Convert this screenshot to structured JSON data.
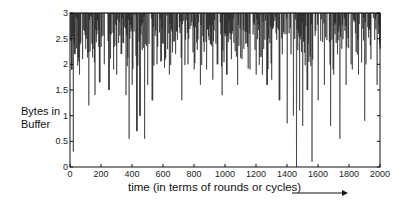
{
  "chart_data": {
    "type": "line",
    "title": "",
    "xlabel": "time (in terms of rounds or cycles)",
    "ylabel": "Bytes in Buffer",
    "xlim": [
      0,
      2000
    ],
    "ylim": [
      0,
      3
    ],
    "xticks": [
      0,
      200,
      400,
      600,
      800,
      1000,
      1200,
      1400,
      1600,
      1800,
      2000
    ],
    "yticks": [
      0,
      0.5,
      1,
      1.5,
      2,
      2.5,
      3
    ],
    "ytick_labels": [
      "0",
      "0.5",
      "1",
      "1.5",
      "2",
      "2.5",
      "3"
    ],
    "grid": false,
    "legend": null,
    "annotations": [
      "arrow pointing right after x-axis label"
    ],
    "series": [
      {
        "name": "Bytes in Buffer",
        "description": "Dense time series mostly saturated at 3 with frequent downward spikes; deepest dips near t≈20 (0.3), t≈380 (0.55), t≈480 (0.55), t≈1460 (0.0), t≈1560 (0.1)",
        "x": [
          0,
          10,
          20,
          30,
          60,
          80,
          100,
          120,
          140,
          160,
          190,
          220,
          250,
          280,
          300,
          330,
          360,
          380,
          400,
          430,
          450,
          480,
          500,
          530,
          560,
          600,
          640,
          680,
          720,
          760,
          800,
          840,
          880,
          920,
          950,
          980,
          1010,
          1040,
          1080,
          1120,
          1160,
          1200,
          1240,
          1270,
          1300,
          1350,
          1400,
          1440,
          1460,
          1480,
          1500,
          1530,
          1560,
          1600,
          1640,
          1680,
          1700,
          1740,
          1780,
          1820,
          1860,
          1900,
          1940,
          1980,
          2000
        ],
        "values": [
          3,
          1.9,
          0.3,
          2.2,
          1.8,
          2.1,
          2.3,
          1.2,
          2.4,
          1.4,
          1.65,
          2.0,
          1.5,
          1.9,
          1.8,
          2.2,
          1.4,
          0.55,
          1.6,
          0.7,
          1.0,
          0.55,
          1.6,
          1.3,
          2.0,
          2.4,
          1.8,
          2.2,
          1.3,
          2.0,
          1.9,
          1.6,
          1.9,
          1.7,
          2.0,
          1.4,
          1.8,
          2.1,
          1.6,
          2.3,
          1.9,
          1.8,
          1.8,
          1.6,
          1.7,
          1.3,
          0.85,
          1.0,
          0.0,
          1.1,
          0.8,
          1.5,
          0.1,
          1.3,
          1.6,
          0.8,
          1.8,
          0.55,
          1.6,
          1.9,
          1.8,
          0.9,
          2.1,
          1.6,
          2.3
        ]
      }
    ]
  }
}
